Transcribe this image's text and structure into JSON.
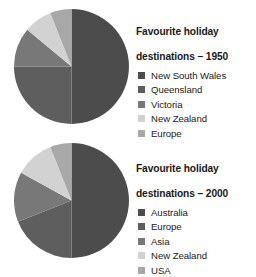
{
  "page": {
    "background": "#ffffff",
    "text_color": "#1a1a1a"
  },
  "palette": {
    "c1": "#4c4c4c",
    "c2": "#5e5e5e",
    "c3": "#787878",
    "c4": "#d2d2d2",
    "c5": "#a8a8a8"
  },
  "charts": [
    {
      "id": "chart-1950",
      "title_line1": "Favourite holiday",
      "title_line2": "destinations – 1950",
      "title": "Favourite holiday destinations – 1950",
      "legend": [
        {
          "label": "New South Wales",
          "color": "#4c4c4c"
        },
        {
          "label": "Queensland",
          "color": "#5e5e5e"
        },
        {
          "label": "Victoria",
          "color": "#787878"
        },
        {
          "label": "New Zealand",
          "color": "#d2d2d2"
        },
        {
          "label": "Europe",
          "color": "#a8a8a8"
        }
      ]
    },
    {
      "id": "chart-2000",
      "title_line1": "Favourite holiday",
      "title_line2": "destinations – 2000",
      "title": "Favourite holiday destinations – 2000",
      "legend": [
        {
          "label": "Australia",
          "color": "#4c4c4c"
        },
        {
          "label": "Europe",
          "color": "#5e5e5e"
        },
        {
          "label": "Asia",
          "color": "#787878"
        },
        {
          "label": "New Zealand",
          "color": "#d2d2d2"
        },
        {
          "label": "USA",
          "color": "#a8a8a8"
        }
      ]
    }
  ],
  "chart_data": [
    {
      "type": "pie",
      "title": "Favourite holiday destinations – 1950",
      "categories": [
        "New South Wales",
        "Queensland",
        "Victoria",
        "New Zealand",
        "Europe"
      ],
      "values": [
        50,
        25,
        11,
        8,
        6
      ],
      "unit": "percent",
      "start_angle_deg": 0,
      "direction": "clockwise",
      "colors": [
        "#4c4c4c",
        "#5e5e5e",
        "#787878",
        "#d2d2d2",
        "#a8a8a8"
      ],
      "legend_position": "right",
      "grid": false
    },
    {
      "type": "pie",
      "title": "Favourite holiday destinations – 2000",
      "categories": [
        "Australia",
        "Europe",
        "Asia",
        "New Zealand",
        "USA"
      ],
      "values": [
        50,
        19,
        14,
        11,
        6
      ],
      "unit": "percent",
      "start_angle_deg": 0,
      "direction": "clockwise",
      "colors": [
        "#4c4c4c",
        "#5e5e5e",
        "#787878",
        "#d2d2d2",
        "#a8a8a8"
      ],
      "legend_position": "right",
      "grid": false
    }
  ]
}
